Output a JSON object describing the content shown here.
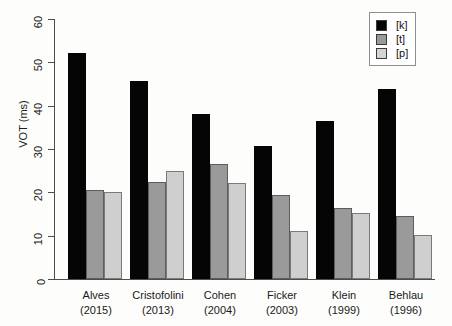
{
  "chart_data": {
    "type": "bar",
    "title": "",
    "xlabel": "",
    "ylabel": "VOT (ms)",
    "ylim": [
      0,
      60
    ],
    "yticks": [
      0,
      10,
      20,
      30,
      40,
      50,
      60
    ],
    "grid": false,
    "legend_position": "top-right",
    "categories": [
      "Alves\n(2015)",
      "Cristofolini\n(2013)",
      "Cohen\n(2004)",
      "Ficker\n(2003)",
      "Klein\n(1999)",
      "Behlau\n(1996)"
    ],
    "category_lines": [
      {
        "name": "Alves",
        "year": "(2015)"
      },
      {
        "name": "Cristofolini",
        "year": "(2013)"
      },
      {
        "name": "Cohen",
        "year": "(2004)"
      },
      {
        "name": "Ficker",
        "year": "(2003)"
      },
      {
        "name": "Klein",
        "year": "(1999)"
      },
      {
        "name": "Behlau",
        "year": "(1996)"
      }
    ],
    "series": [
      {
        "name": "[k]",
        "color": "#050505",
        "values": [
          52.2,
          45.6,
          38.0,
          30.8,
          36.4,
          43.8
        ]
      },
      {
        "name": "[t]",
        "color": "#9a9a9a",
        "values": [
          20.6,
          22.5,
          26.6,
          19.4,
          16.5,
          14.6
        ]
      },
      {
        "name": "[p]",
        "color": "#cfcfcf",
        "values": [
          20.1,
          25.0,
          22.2,
          11.0,
          15.3,
          10.2
        ]
      }
    ]
  },
  "legend": {
    "items": [
      {
        "label": "[k]",
        "series": "k"
      },
      {
        "label": "[t]",
        "series": "t"
      },
      {
        "label": "[p]",
        "series": "p"
      }
    ]
  }
}
